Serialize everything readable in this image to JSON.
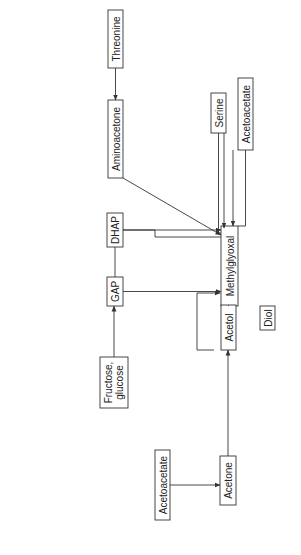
{
  "diagram": {
    "orientation": "rotated-90-ccw",
    "nodes": {
      "threonine": "Threonine",
      "aminoacetone": "Aminoacetone",
      "dhap": "DHAP",
      "gap": "GAP",
      "fructose_glucose_line1": "Fructose,",
      "fructose_glucose_line2": "glucose",
      "methylglyoxal": "Methylglyoxal",
      "serine": "Serine",
      "acetoacetate_top": "Acetoacetate",
      "acetol": "Acetol",
      "diol": "Diol",
      "acetone": "Acetone",
      "acetoacetate_bottom": "Acetoacetate"
    },
    "edge_labels": {
      "ssao": "SSAO",
      "mgs": "MGS",
      "ros": "ROS",
      "mpo": "MPO",
      "cu": "Cu",
      "cu_sup": "2+",
      "p450_acetol": "P",
      "p450_acetol_sub": "450",
      "p450_acetone": "P",
      "p450_acetone_sub": "450"
    },
    "edges": [
      {
        "from": "Threonine",
        "to": "Aminoacetone"
      },
      {
        "from": "Aminoacetone",
        "to": "Methylglyoxal",
        "label": "SSAO"
      },
      {
        "from": "DHAP",
        "to": "Methylglyoxal",
        "label": "MGS"
      },
      {
        "from": "GAP",
        "to": "Methylglyoxal",
        "label": "ROS"
      },
      {
        "from": "Fructose, glucose",
        "to": "GAP"
      },
      {
        "from": "Serine",
        "to": "Methylglyoxal"
      },
      {
        "from": "Acetoacetate",
        "to": "Methylglyoxal",
        "label": "MPO"
      },
      {
        "from": "Acetol",
        "to": "Methylglyoxal",
        "label": "Cu2+"
      },
      {
        "from": "Acetol",
        "to": "Methylglyoxal",
        "label": "P450"
      },
      {
        "from": "Acetol",
        "to": "Diol"
      },
      {
        "from": "Acetone",
        "to": "Acetol",
        "label": "P450"
      },
      {
        "from": "Acetoacetate",
        "to": "Acetone"
      }
    ],
    "structures": {
      "threonine": {
        "co2": "CO",
        "co2_sub": "2",
        "co2_sup": "−",
        "h2n": "H",
        "h2n_sub": "2",
        "h2n_n": "N",
        "ch": "CH",
        "c": "C",
        "oh": "OH",
        "h": "H",
        "ch3": "CH",
        "ch3_sub": "3"
      },
      "aminoacetone": {
        "nh2": "NH",
        "nh2_sub": "2",
        "ch2": "CH",
        "ch2_sub": "2",
        "c": "C",
        "o": "O",
        "ch3": "CH",
        "ch3_sub": "3"
      },
      "dhap": {
        "o": "O",
        "c1": "C",
        "h1": "H",
        "c2": "C",
        "oh": "OH",
        "h2": "H",
        "ch2op": "CH",
        "ch2op_sub": "2",
        "ch2op_tail": "OP"
      },
      "gap": {
        "ch2op": "CH",
        "ch2op_sub": "2",
        "ch2op_tail": "OP",
        "c": "C",
        "o": "O",
        "ch3": "CH",
        "ch3_sub": "3"
      },
      "serine": {
        "nh2": "NH",
        "nh2_sub": "2",
        "h2coh": "H",
        "h2coh_sub": "2",
        "h2coh_tail": "COH",
        "ch": "CH",
        "cooh": "COOH"
      },
      "acetoacetate": {
        "h3c": "H",
        "h3c_sub": "3",
        "h3c_tail": "C",
        "c": "C",
        "o": "O",
        "h2": "H",
        "h2_sub": "2",
        "c2": "C",
        "cooh": "COOH"
      },
      "methylglyoxal": {
        "o1": "O",
        "o2": "O",
        "ch": "CH",
        "c": "C",
        "h3c": "H",
        "h3c_sub": "3",
        "h3c_tail": "C"
      },
      "acetol": {
        "h3c": "H",
        "h3c_sub": "3",
        "h3c_tail": "C",
        "c": "C",
        "o": "O",
        "ch2oh": "CH",
        "ch2oh_sub": "2",
        "ch2oh_tail": "OH"
      },
      "acetone": {
        "h3c": "H",
        "h3c_sub": "3",
        "h3c_tail": "C",
        "c": "C",
        "o": "O",
        "ch3": "CH",
        "ch3_sub": "3"
      },
      "sugars": {
        "ch2oh": "CH",
        "ch2oh_sub": "2",
        "ch2oh_tail": "OH",
        "oh": "OH",
        "ho": "HO",
        "o": "O"
      }
    }
  }
}
